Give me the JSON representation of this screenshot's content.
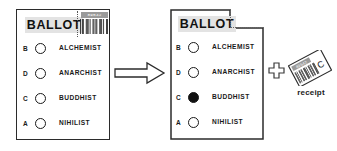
{
  "diagram": {
    "background_color": "#ffffff",
    "ink_color": "#1a1a1a",
    "title_box_color": "#e3e3e3"
  },
  "ballot_before": {
    "title": "BALLOT",
    "barcode": {
      "number": "89542",
      "pattern": "1011001110100110110011101001101"
    },
    "stub_attached": true,
    "options": [
      {
        "letter": "B",
        "name": "ALCHEMIST",
        "selected": false
      },
      {
        "letter": "D",
        "name": "ANARCHIST",
        "selected": false
      },
      {
        "letter": "C",
        "name": "BUDDHIST",
        "selected": false
      },
      {
        "letter": "A",
        "name": "NIHILIST",
        "selected": false
      }
    ]
  },
  "ballot_after": {
    "title": "BALLOT",
    "stub_attached": false,
    "tear_style": "dotted",
    "options": [
      {
        "letter": "B",
        "name": "ALCHEMIST",
        "selected": false
      },
      {
        "letter": "D",
        "name": "ANARCHIST",
        "selected": false
      },
      {
        "letter": "C",
        "name": "BUDDHIST",
        "selected": true
      },
      {
        "letter": "A",
        "name": "NIHILIST",
        "selected": false
      }
    ]
  },
  "arrow": {
    "direction": "right",
    "style": "outlined-block-arrow"
  },
  "plus": {
    "symbol": "+",
    "style": "outlined-cross"
  },
  "receipt": {
    "caption": "receipt",
    "mark_letter": "C",
    "number": "89542",
    "pattern": "110100110110011101001101100111",
    "rotation_deg": -28
  }
}
